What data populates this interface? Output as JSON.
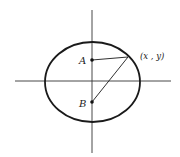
{
  "diagram": {
    "colors": {
      "stroke": "#1a1a1a",
      "axis": "#333333",
      "background": "#ffffff"
    },
    "axes": {
      "horizontal": {
        "x1": 15,
        "x2": 171,
        "y": 81
      },
      "vertical": {
        "x": 92,
        "y1": 10,
        "y2": 153
      }
    },
    "ellipse": {
      "cx": 92.5,
      "cy": 82,
      "rx": 47.5,
      "ry": 40
    },
    "points": {
      "A": {
        "label": "A",
        "x": 92,
        "y": 60
      },
      "B": {
        "label": "B",
        "x": 92,
        "y": 102
      },
      "P": {
        "label": "(x , y)",
        "x": 128,
        "y": 57
      }
    },
    "segments": [
      {
        "from": "A",
        "to": "P"
      },
      {
        "from": "B",
        "to": "P"
      }
    ]
  }
}
